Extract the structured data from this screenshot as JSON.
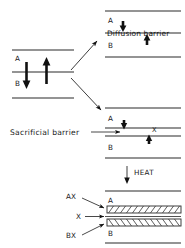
{
  "figure": {
    "ink_color": "#1a1a1a",
    "background": "#ffffff"
  },
  "panels": {
    "initial": {
      "name": "initial-couple",
      "layer_top_label": "A",
      "layer_bottom_label": "B",
      "arrow_down_name": "interdiffusion-arrow-down",
      "arrow_up_name": "interdiffusion-arrow-up"
    },
    "diffusion": {
      "name": "diffusion-barrier-panel",
      "layer_top_label": "A",
      "layer_bottom_label": "B",
      "barrier_label": "Diffusion barrier",
      "arrow_top_name": "blocked-flux-arrow-top",
      "arrow_bottom_name": "blocked-flux-arrow-bottom"
    },
    "sacrificial": {
      "name": "sacrificial-barrier-panel",
      "layer_top_label": "A",
      "layer_bottom_label": "B",
      "interlayer_label": "X",
      "callout_label": "Sacrificial barrier",
      "arrow_top_name": "flux-arrow-top",
      "arrow_bottom_name": "flux-arrow-bottom"
    },
    "heat": {
      "name": "heat-step",
      "label": "HEAT",
      "arrow_name": "heat-arrow-down"
    },
    "reacted": {
      "name": "reacted-joint-panel",
      "layer_top_label": "A",
      "layer_bottom_label": "B",
      "callouts": [
        {
          "label": "AX",
          "name": "callout-ax",
          "target": "upper-reaction-band"
        },
        {
          "label": "X",
          "name": "callout-x",
          "target": "remaining-interlayer"
        },
        {
          "label": "BX",
          "name": "callout-bx",
          "target": "lower-reaction-band"
        }
      ]
    }
  }
}
